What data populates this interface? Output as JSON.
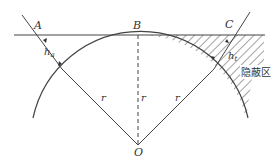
{
  "diagram": {
    "labels": {
      "A": "A",
      "B": "B",
      "C": "C",
      "O": "O",
      "h_a": "h",
      "h_a_sub": "a",
      "h_t": "h",
      "h_t_sub": "t",
      "r_left": "r",
      "r_center": "r",
      "r_right": "r",
      "hidden_zone": "隐蔽区"
    },
    "colors": {
      "line": "#444444",
      "hatch": "#555555",
      "background": "#ffffff"
    }
  }
}
